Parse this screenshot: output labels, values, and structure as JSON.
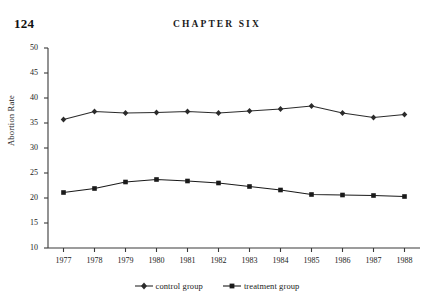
{
  "page": {
    "number": "124",
    "running_head": "CHAPTER SIX"
  },
  "chart_data": {
    "type": "line",
    "title": "",
    "xlabel": "",
    "ylabel": "Abortion Rate",
    "categories": [
      "1977",
      "1978",
      "1979",
      "1980",
      "1981",
      "1982",
      "1983",
      "1984",
      "1985",
      "1986",
      "1987",
      "1988"
    ],
    "series": [
      {
        "name": "control group",
        "marker": "diamond",
        "color": "#2b2b2b",
        "values": [
          35.7,
          37.3,
          37.0,
          37.1,
          37.3,
          37.0,
          37.4,
          37.8,
          38.4,
          37.0,
          36.1,
          36.7
        ]
      },
      {
        "name": "treatment group",
        "marker": "square",
        "color": "#1a1a1a",
        "values": [
          21.1,
          21.9,
          23.2,
          23.7,
          23.4,
          23.0,
          22.3,
          21.6,
          20.7,
          20.6,
          20.5,
          20.3
        ]
      }
    ],
    "ylim": [
      10,
      50
    ],
    "yticks": [
      50,
      45,
      40,
      35,
      30,
      25,
      20,
      15,
      10
    ],
    "grid": false,
    "legend_position": "bottom"
  },
  "legend": {
    "items": [
      {
        "label": "control group"
      },
      {
        "label": "treatment group"
      }
    ]
  }
}
